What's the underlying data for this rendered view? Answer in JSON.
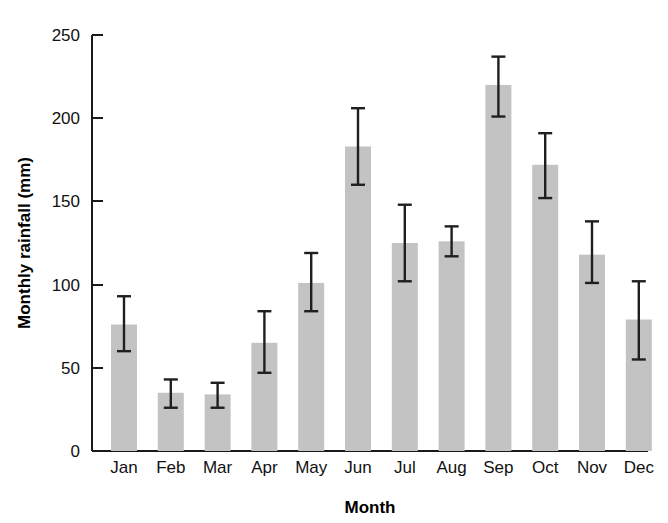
{
  "chart_data": {
    "type": "bar",
    "title": "",
    "xlabel": "Month",
    "ylabel": "Monthly rainfall (mm)",
    "categories": [
      "Jan",
      "Feb",
      "Mar",
      "Apr",
      "May",
      "Jun",
      "Jul",
      "Aug",
      "Sep",
      "Oct",
      "Nov",
      "Dec"
    ],
    "values": [
      76,
      35,
      34,
      65,
      101,
      183,
      125,
      126,
      220,
      172,
      118,
      79
    ],
    "error_low": [
      60,
      26,
      26,
      47,
      84,
      160,
      102,
      117,
      201,
      152,
      101,
      55
    ],
    "error_high": [
      93,
      43,
      41,
      84,
      119,
      206,
      148,
      135,
      237,
      191,
      138,
      102
    ],
    "ylim": [
      0,
      250
    ],
    "yticks": [
      0,
      50,
      100,
      150,
      200,
      250
    ],
    "ytick_labels": [
      "0",
      "50",
      "100",
      "150",
      "200",
      "250"
    ],
    "grid": false,
    "legend": null,
    "bar_color": "#c3c3c3",
    "axis_color": "#1a1a1a",
    "error_bar_color": "#1f1f1f"
  },
  "labels": {
    "y_axis_title": "Monthly rainfall (mm)",
    "x_axis_title": "Month"
  }
}
